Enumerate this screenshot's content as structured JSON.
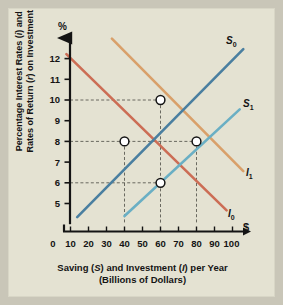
{
  "figure": {
    "background_color": "#c9c6b8",
    "panel_color": "#e4e2d2"
  },
  "chart_data": {
    "type": "line",
    "title": "",
    "xlabel_line1": "Saving (S) and Investment (I) per Year",
    "xlabel_line2": "(Billions of Dollars)",
    "ylabel_line1": "Percentage Interest Rates (i) and",
    "ylabel_line2": "Rates of Return (r) on Investment",
    "y_axis_symbol": "%",
    "x_axis_symbol": "$",
    "xlim": [
      0,
      110
    ],
    "ylim": [
      4,
      12.8
    ],
    "grid": "dashed-guides-only",
    "legend": "inline-curve-labels",
    "x_ticks": [
      0,
      10,
      20,
      30,
      40,
      50,
      60,
      70,
      80,
      90,
      100
    ],
    "y_ticks": [
      5,
      6,
      7,
      8,
      9,
      10,
      11,
      12
    ],
    "series": [
      {
        "name": "S0",
        "label": "S",
        "sub": "0",
        "color": "#4a7fa0",
        "kind": "supply-upward",
        "points": [
          [
            14,
            4.35
          ],
          [
            106,
            12.45
          ]
        ],
        "label_x": 103,
        "label_y": 12.6
      },
      {
        "name": "S1",
        "label": "S",
        "sub": "1",
        "color": "#6aafc4",
        "kind": "supply-upward",
        "points": [
          [
            50,
            4.4
          ],
          [
            104,
            9.55
          ]
        ],
        "label_x": 103,
        "label_y": 9.9
      },
      {
        "name": "I0",
        "label": "I",
        "sub": "0",
        "color": "#cc6d55",
        "kind": "investment-downward",
        "points": [
          [
            8,
            11.95
          ],
          [
            97,
            4.4
          ]
        ],
        "label_x": 99,
        "label_y": 4.35
      },
      {
        "name": "I1",
        "label": "I",
        "sub": "1",
        "color": "#d9a06a",
        "kind": "investment-downward",
        "points": [
          [
            33,
            12.7
          ],
          [
            106,
            6.25
          ]
        ],
        "label_x": 104,
        "label_y": 6.1
      }
    ],
    "equilibrium_points": [
      {
        "name": "E-S0-I1",
        "x": 70,
        "y": 10
      },
      {
        "name": "E-S0-I0",
        "x": 50,
        "y": 8
      },
      {
        "name": "E-S1-I1",
        "x": 90,
        "y": 8
      },
      {
        "name": "E-S1-I0",
        "x": 70,
        "y": 6
      }
    ],
    "guide_lines": [
      {
        "type": "horizontal",
        "y": 10,
        "from_x": 0,
        "to_x": 70
      },
      {
        "type": "horizontal",
        "y": 8,
        "from_x": 0,
        "to_x": 90
      },
      {
        "type": "horizontal",
        "y": 6,
        "from_x": 0,
        "to_x": 70
      },
      {
        "type": "vertical",
        "x": 50,
        "from_y": 4,
        "to_y": 8
      },
      {
        "type": "vertical",
        "x": 70,
        "from_y": 4,
        "to_y": 10
      },
      {
        "type": "vertical",
        "x": 90,
        "from_y": 4,
        "to_y": 8
      }
    ]
  },
  "axis_labels": {
    "y": [
      "12",
      "11",
      "10",
      "9",
      "8",
      "7",
      "6",
      "5"
    ],
    "x": [
      "0",
      "10",
      "20",
      "30",
      "40",
      "50",
      "60",
      "70",
      "80",
      "90",
      "100"
    ]
  }
}
